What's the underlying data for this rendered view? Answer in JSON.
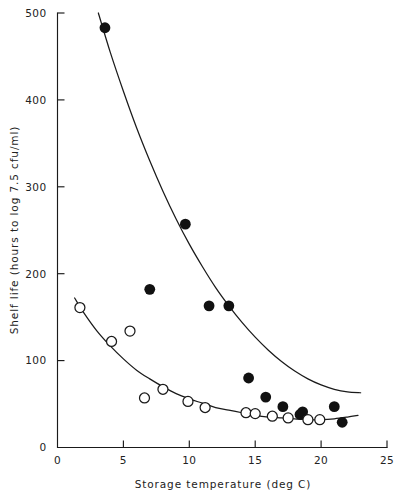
{
  "figure": {
    "name": "shelf-life-vs-storage-temperature-scatter"
  },
  "axes": {
    "x_title": "Storage temperature (deg C)",
    "y_title": "Shelf life (hours to log 7.5 cfu/ml)",
    "x_ticks": [
      "0",
      "5",
      "10",
      "15",
      "20",
      "25"
    ],
    "y_ticks": [
      "0",
      "100",
      "200",
      "300",
      "400",
      "500"
    ]
  },
  "chart_data": {
    "type": "scatter",
    "title": "",
    "xlabel": "Storage temperature (deg C)",
    "ylabel": "Shelf life (hours to log 7.5 cfu/ml)",
    "xlim": [
      0,
      25
    ],
    "ylim": [
      0,
      500
    ],
    "xticks": [
      0,
      5,
      10,
      15,
      20,
      25
    ],
    "yticks": [
      0,
      100,
      200,
      300,
      400,
      500
    ],
    "grid": false,
    "legend": "none",
    "series": [
      {
        "name": "closed circles",
        "marker": "filled-circle",
        "x": [
          3.6,
          7.0,
          9.7,
          11.5,
          13.0,
          14.5,
          15.8,
          17.1,
          18.4,
          18.6,
          21.0,
          21.6
        ],
        "y": [
          483,
          182,
          257,
          163,
          163,
          80,
          58,
          47,
          38,
          41,
          47,
          29
        ],
        "fit": {
          "description": "decaying curve through closed circles",
          "points": [
            [
              3.1,
              500
            ],
            [
              4.0,
              455
            ],
            [
              5.0,
              410
            ],
            [
              6.0,
              368
            ],
            [
              7.0,
              330
            ],
            [
              8.0,
              295
            ],
            [
              9.0,
              263
            ],
            [
              10.0,
              234
            ],
            [
              11.0,
              208
            ],
            [
              12.0,
              184
            ],
            [
              13.0,
              163
            ],
            [
              14.0,
              144
            ],
            [
              15.0,
              127
            ],
            [
              16.0,
              112
            ],
            [
              17.0,
              99
            ],
            [
              18.0,
              88
            ],
            [
              19.0,
              79
            ],
            [
              20.0,
              72
            ],
            [
              21.0,
              67
            ],
            [
              22.0,
              64
            ],
            [
              23.0,
              63
            ]
          ]
        }
      },
      {
        "name": "open circles",
        "marker": "open-circle",
        "x": [
          1.7,
          4.1,
          5.5,
          6.6,
          8.0,
          9.9,
          11.2,
          14.3,
          15.0,
          16.3,
          17.5,
          19.0,
          19.9
        ],
        "y": [
          161,
          122,
          134,
          57,
          67,
          53,
          46,
          40,
          39,
          36,
          34,
          32,
          32
        ],
        "fit": {
          "description": "decaying curve through open circles",
          "points": [
            [
              1.3,
              172
            ],
            [
              2.0,
              155
            ],
            [
              3.0,
              134
            ],
            [
              4.0,
              117
            ],
            [
              5.0,
              102
            ],
            [
              6.0,
              89
            ],
            [
              7.0,
              79
            ],
            [
              8.0,
              70
            ],
            [
              9.0,
              62
            ],
            [
              10.0,
              56
            ],
            [
              11.0,
              51
            ],
            [
              12.0,
              46
            ],
            [
              13.0,
              43
            ],
            [
              14.0,
              40
            ],
            [
              15.0,
              37
            ],
            [
              16.0,
              35
            ],
            [
              17.0,
              34
            ],
            [
              18.0,
              33
            ],
            [
              19.0,
              32
            ],
            [
              20.0,
              32
            ],
            [
              21.0,
              33
            ],
            [
              22.0,
              35
            ],
            [
              22.8,
              37
            ]
          ]
        }
      }
    ]
  }
}
